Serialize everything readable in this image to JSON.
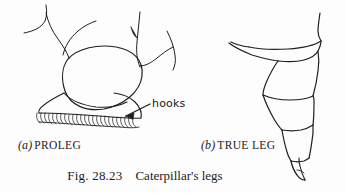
{
  "figure": {
    "caption_number": "Fig. 28.23",
    "caption_title": "Caterpillar's legs",
    "background_color": "#fdfdfd",
    "ink_color": "#1a1a1a"
  },
  "panels": [
    {
      "key": "a",
      "paren_label": "(a)",
      "name": "PROLEG",
      "annotation": {
        "text": "hooks",
        "target": "crochet-row",
        "leader": "arrow"
      },
      "parts": [
        "body-wall-folds",
        "proleg-body-oval",
        "planta",
        "crochet-row"
      ]
    },
    {
      "key": "b",
      "paren_label": "(b)",
      "name": "TRUE LEG",
      "parts": [
        "coxa",
        "trochanter",
        "femur",
        "tibia",
        "tarsus",
        "claw"
      ]
    }
  ],
  "icons": {
    "arrow": "arrow-icon",
    "claw": "claw-icon",
    "hooks": "hooks-icon"
  }
}
